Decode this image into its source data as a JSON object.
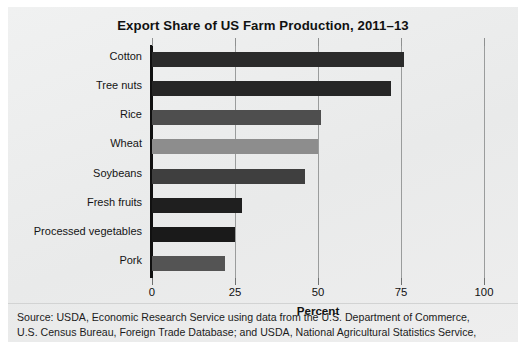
{
  "chart_data": {
    "type": "bar",
    "orientation": "horizontal",
    "title": "Export Share of US Farm Production, 2011–13",
    "xlabel": "Percent",
    "ylabel": "",
    "xlim": [
      0,
      100
    ],
    "xticks": [
      0,
      25,
      50,
      75,
      100
    ],
    "xtick_labels": [
      "0",
      "25",
      "50",
      "75",
      "100"
    ],
    "grid": "vertical",
    "legend": "none",
    "categories": [
      "Cotton",
      "Tree nuts",
      "Rice",
      "Wheat",
      "Soybeans",
      "Fresh fruits",
      "Processed vegetables",
      "Pork"
    ],
    "values": [
      76,
      72,
      51,
      50,
      46,
      27,
      25,
      22
    ],
    "bar_colors": [
      "#2b2b2b",
      "#262626",
      "#4e4e4e",
      "#8d8d8d",
      "#3f3f3f",
      "#1f1f1f",
      "#1a1a1a",
      "#545454"
    ]
  },
  "source": {
    "line1": "Source: USDA, Economic Research Service using data from the U.S. Department of Commerce,",
    "line2": "U.S. Census Bureau, Foreign Trade Database; and USDA, National Agricultural Statistics Service,"
  },
  "colors": {
    "background": "#eceded",
    "axis": "#111111",
    "gridline": "#9a9c9c",
    "text": "#111111"
  }
}
